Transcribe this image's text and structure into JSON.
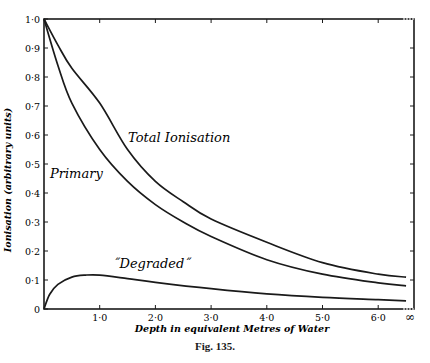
{
  "figure": {
    "caption": "Fig. 135."
  },
  "chart_data": {
    "type": "line",
    "title": "",
    "xlabel": "Depth in equivalent Metres of Water",
    "ylabel": "Ionisation (arbitrary units)",
    "xlim": [
      0,
      7.0
    ],
    "ylim": [
      0,
      1.0
    ],
    "x_ticks": [
      "1·0",
      "2·0",
      "3·0",
      "4·0",
      "5·0",
      "6·0",
      "∞"
    ],
    "y_ticks": [
      "0",
      "0·1",
      "0·2",
      "0·3",
      "0·4",
      "0·5",
      "0·6",
      "0·7",
      "0·8",
      "0·9",
      "1·0"
    ],
    "grid": false,
    "legend": "inline labels",
    "series": [
      {
        "name": "Total Ionisation",
        "label_text": "Total Ionisation",
        "x": [
          0,
          0.25,
          0.5,
          1.0,
          1.5,
          2.0,
          2.5,
          3.0,
          4.0,
          5.0,
          6.0,
          6.5
        ],
        "values": [
          1.0,
          0.91,
          0.83,
          0.71,
          0.55,
          0.44,
          0.37,
          0.31,
          0.23,
          0.16,
          0.12,
          0.11
        ]
      },
      {
        "name": "Primary",
        "label_text": "Primary",
        "x": [
          0,
          0.25,
          0.5,
          1.0,
          1.5,
          2.0,
          2.5,
          3.0,
          4.0,
          5.0,
          6.0,
          6.5
        ],
        "values": [
          1.0,
          0.84,
          0.71,
          0.55,
          0.44,
          0.36,
          0.3,
          0.25,
          0.17,
          0.12,
          0.09,
          0.08
        ]
      },
      {
        "name": "Degraded",
        "label_text": "˝Degraded˝",
        "x": [
          0,
          0.1,
          0.25,
          0.5,
          0.75,
          1.0,
          1.5,
          2.0,
          3.0,
          4.0,
          5.0,
          6.0,
          6.5
        ],
        "values": [
          0,
          0.05,
          0.085,
          0.11,
          0.117,
          0.117,
          0.105,
          0.092,
          0.07,
          0.052,
          0.04,
          0.032,
          0.028
        ]
      }
    ]
  }
}
